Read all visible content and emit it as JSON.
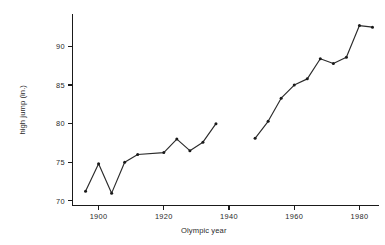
{
  "chart_data": {
    "type": "line",
    "title": "",
    "xlabel": "Olympic year",
    "ylabel": "high jump (in.)",
    "xlim": [
      1892,
      1986
    ],
    "ylim": [
      69.4,
      94.2
    ],
    "grid": false,
    "legend": "none",
    "marker": "filled-circle",
    "series": [
      {
        "name": "Olympic gold medal high jump",
        "x": [
          1896,
          1900,
          1904,
          1908,
          1912,
          1920,
          1924,
          1928,
          1932,
          1936,
          1948,
          1952,
          1956,
          1960,
          1964,
          1968,
          1972,
          1976,
          1980,
          1984
        ],
        "y": [
          71.25,
          74.8,
          71.0,
          75.0,
          76.0,
          76.25,
          78.0,
          76.5,
          77.6,
          80.0,
          78.1,
          80.3,
          83.3,
          85.0,
          85.8,
          88.4,
          87.8,
          88.6,
          92.7,
          92.5
        ],
        "gaps": [
          {
            "after_x": 1936,
            "before_x": 1948,
            "reason": "no games 1940-1944"
          }
        ]
      }
    ],
    "x_ticks": [
      1900,
      1920,
      1940,
      1960,
      1980
    ],
    "x_tick_labels": [
      "1900",
      "1920",
      "1940",
      "1960",
      "1980"
    ],
    "y_ticks": [
      70,
      75,
      80,
      85,
      90
    ],
    "y_tick_labels": [
      "70",
      "75",
      "80",
      "85",
      "90"
    ],
    "colors": {
      "line": "#2b2b2b",
      "marker": "#1a1a1a",
      "axis": "#1a1a1a",
      "text": "#2a2a2a",
      "background": "#ffffff"
    }
  }
}
